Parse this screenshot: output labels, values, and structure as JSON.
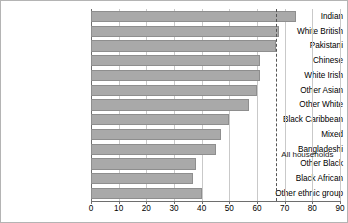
{
  "chart_data": {
    "type": "bar",
    "orientation": "horizontal",
    "title": "",
    "subtitle": "",
    "xlabel": "",
    "ylabel": "",
    "xlim": [
      0,
      90
    ],
    "xticks": [
      0,
      10,
      20,
      30,
      40,
      50,
      60,
      70,
      80,
      90
    ],
    "xtick_labels": [
      "0",
      "10",
      "20",
      "30",
      "40",
      "50",
      "60",
      "70",
      "80",
      "90"
    ],
    "grid": true,
    "grid_axis": "x",
    "legend": false,
    "categories": [
      "Indian",
      "White British",
      "Pakistani",
      "Chinese",
      "White Irish",
      "Other Asian",
      "Other White",
      "Black Caribbean",
      "Mixed",
      "Bangladeshi",
      "Other Black",
      "Black African",
      "Other ethnic group"
    ],
    "values": [
      74,
      68,
      67,
      61,
      61,
      60,
      57,
      50,
      47,
      45,
      38,
      37,
      40
    ],
    "bar_color": "#a9a9a9",
    "bar_edge_color": "#8e8e8e",
    "annotations": [
      {
        "name": "all-households",
        "label": "All households",
        "value": 67,
        "style": "dashed-vertical-line",
        "color": "#555555"
      }
    ]
  }
}
